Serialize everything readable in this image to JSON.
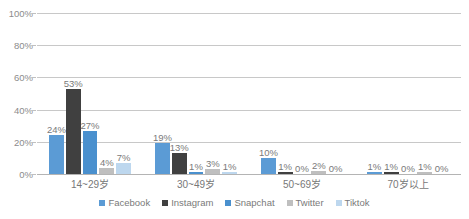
{
  "chart_data": {
    "type": "bar",
    "title": "",
    "subtitle": "",
    "xlabel": "",
    "ylabel": "",
    "ylim": [
      0,
      100
    ],
    "yticks": [
      "0%",
      "20%",
      "40%",
      "60%",
      "80%",
      "100%"
    ],
    "ytick_values": [
      0,
      20,
      40,
      60,
      80,
      100
    ],
    "grid": true,
    "value_suffix": "%",
    "legend_position": "bottom",
    "categories": [
      "14~29岁",
      "30~49岁",
      "50~69岁",
      "70岁以上"
    ],
    "series": [
      {
        "name": "Facebook",
        "color": "#5B9BD5",
        "values": [
          24,
          19,
          10,
          1
        ],
        "labels": [
          "24%",
          "19%",
          "10%",
          "1%"
        ]
      },
      {
        "name": "Instagram",
        "color": "#404040",
        "values": [
          53,
          13,
          1,
          1
        ],
        "labels": [
          "53%",
          "13%",
          "1%",
          "1%"
        ]
      },
      {
        "name": "Snapchat",
        "color": "#4A90CE",
        "values": [
          27,
          1,
          0,
          0
        ],
        "labels": [
          "27%",
          "1%",
          "0%",
          "0%"
        ]
      },
      {
        "name": "Twitter",
        "color": "#BFBFBF",
        "values": [
          4,
          3,
          2,
          1
        ],
        "labels": [
          "4%",
          "3%",
          "2%",
          "1%"
        ]
      },
      {
        "name": "Tiktok",
        "color": "#BDD7EE",
        "values": [
          7,
          1,
          0,
          0
        ],
        "labels": [
          "7%",
          "1%",
          "0%",
          "0%"
        ]
      }
    ]
  }
}
